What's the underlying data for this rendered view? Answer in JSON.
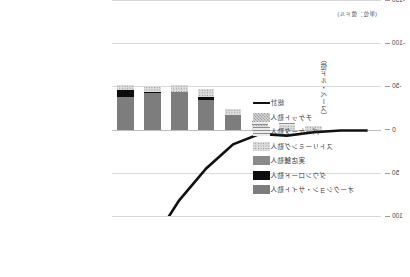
{
  "unit_note": "(単位：億ドル)",
  "chart_data": {
    "type": "bar",
    "title": "",
    "subtitle": "",
    "xlabel": "",
    "ylabel": "（億ドル・ベース）",
    "unit_note": "(単位：億ドル)",
    "orientation": "mirrored-horizontal",
    "grid": true,
    "legend_position": "left",
    "categories": [
      "2012",
      "2013",
      "2014",
      "2015",
      "2016",
      "2017",
      "2018",
      "2019",
      "2020",
      "2021"
    ],
    "ylim": [
      -150,
      100
    ],
    "yticks": [
      -150,
      -100,
      -50,
      0,
      50,
      100
    ],
    "ytick_labels": [
      "-150",
      "-100",
      "-50",
      "0",
      "50",
      "100"
    ],
    "y_axis_inverted": true,
    "series": [
      {
        "name": "オークション・サイト勤人",
        "type": "bar-stack",
        "fill": "solid-dark",
        "color": "#7d7d7d",
        "values": [
          0,
          0,
          0,
          0,
          0,
          -17,
          -34,
          -44,
          -42,
          -38
        ]
      },
      {
        "name": "ダウンロード勤人",
        "type": "bar-stack",
        "fill": "black",
        "color": "#0d0d0d",
        "values": [
          0,
          0,
          0,
          0,
          0,
          0,
          -4,
          0,
          -2,
          -8
        ]
      },
      {
        "name": "実店舗勤人",
        "type": "bar-stack",
        "fill": "mid",
        "color": "#8a8a8a",
        "values": [
          0,
          0,
          0,
          0,
          0,
          0,
          0,
          0,
          0,
          0
        ]
      },
      {
        "name": "ストリーミング勤人",
        "type": "bar-stack",
        "fill": "dots",
        "color": "#dcdcdc",
        "values": [
          0,
          0,
          -4,
          -5,
          -6,
          -7,
          -9,
          -8,
          -6,
          -6
        ]
      },
      {
        "name": "パーケータ勤人",
        "type": "bar-stack",
        "fill": "hline",
        "color": "#e2e2e2",
        "values": [
          0,
          0,
          0,
          -3,
          -4,
          0,
          0,
          0,
          0,
          0
        ]
      },
      {
        "name": "チケット勤人",
        "type": "bar-stack",
        "fill": "checker",
        "color": "#d7d7d7",
        "values": [
          0,
          0,
          0,
          0,
          0,
          0,
          0,
          0,
          0,
          0
        ]
      },
      {
        "name": "総計",
        "type": "line",
        "color": "#111111",
        "values": [
          1,
          1,
          3,
          7,
          5,
          17,
          45,
          82,
          130,
          105
        ]
      }
    ],
    "legend_entries": [
      {
        "label": "総計",
        "kind": "line",
        "fill": "line"
      },
      {
        "label": "チケット勤人",
        "kind": "bar",
        "fill": "checker"
      },
      {
        "label": "パーケータ勤人",
        "kind": "bar",
        "fill": "hline"
      },
      {
        "label": "ストリーミング勤人",
        "kind": "bar",
        "fill": "dots"
      },
      {
        "label": "実店舗勤人",
        "kind": "bar",
        "fill": "mid"
      },
      {
        "label": "ダウンロード勤人",
        "kind": "bar",
        "fill": "black"
      },
      {
        "label": "オークション・サイト勤人",
        "kind": "bar",
        "fill": "solid-dark"
      }
    ]
  },
  "colors": {
    "grid": "#d9d9d9",
    "axis": "#bfbfbf",
    "line": "#111111",
    "text": "#3a3a3a",
    "background": "#ffffff"
  }
}
